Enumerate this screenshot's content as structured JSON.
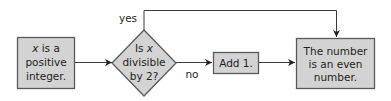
{
  "diagram": {
    "type": "flowchart",
    "colors": {
      "node_fill": "#d3d3d3",
      "node_stroke": "#5a5a5a",
      "line": "#3a3a3a",
      "text": "#231f20"
    },
    "nodes": {
      "start": {
        "shape": "rectangle",
        "lines": [
          "x",
          " is a",
          "positive",
          "integer."
        ],
        "text": "x is a positive integer."
      },
      "decision": {
        "shape": "diamond",
        "lines": [
          "Is ",
          "x",
          "divisible",
          "by 2?"
        ],
        "text": "Is x divisible by 2?"
      },
      "add_one": {
        "shape": "rectangle",
        "lines": [
          "Add 1."
        ],
        "text": "Add 1."
      },
      "result": {
        "shape": "rectangle",
        "lines": [
          "The number",
          "is an even",
          "number."
        ],
        "text": "The number is an even number."
      }
    },
    "edges": [
      {
        "from": "start",
        "to": "decision",
        "label": ""
      },
      {
        "from": "decision",
        "to": "result",
        "label": "yes"
      },
      {
        "from": "decision",
        "to": "add_one",
        "label": "no"
      },
      {
        "from": "add_one",
        "to": "result",
        "label": ""
      }
    ],
    "labels": {
      "yes": "yes",
      "no": "no"
    }
  }
}
